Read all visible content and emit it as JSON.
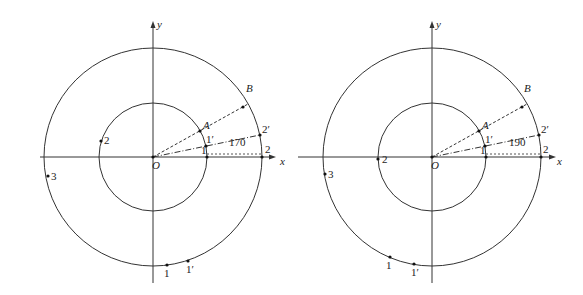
{
  "figures": [
    {
      "id": "left",
      "origin": {
        "x": 153,
        "y": 157
      },
      "inner_radius": 54,
      "outer_radius": 109,
      "axes": {
        "x_label": "x",
        "y_label": "y",
        "origin_label": "O"
      },
      "angle_label": "170",
      "points": {
        "A": "A",
        "B": "B",
        "one": "1",
        "two": "2",
        "one_prime": "1′",
        "two_prime": "2′"
      },
      "extra_labels": {
        "p2": "2",
        "p3": "3",
        "p1": "1",
        "p1prime": "1′"
      }
    },
    {
      "id": "right",
      "origin": {
        "x": 432,
        "y": 157
      },
      "inner_radius": 54,
      "outer_radius": 109,
      "axes": {
        "x_label": "x",
        "y_label": "y",
        "origin_label": "O"
      },
      "angle_label": "190",
      "points": {
        "A": "A",
        "B": "B",
        "one": "1",
        "two": "2",
        "one_prime": "1′",
        "two_prime": "2′"
      },
      "extra_labels": {
        "p2": "2",
        "p3": "3",
        "p1": "1",
        "p1prime": "1′"
      }
    }
  ]
}
